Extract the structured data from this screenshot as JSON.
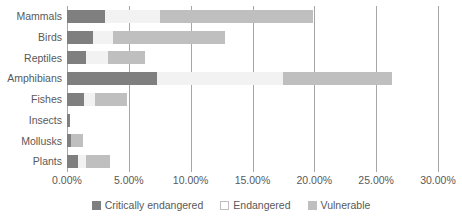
{
  "chart_data": {
    "type": "bar",
    "orientation": "horizontal",
    "stacked": true,
    "title": "",
    "xlabel": "",
    "ylabel": "",
    "xlim": [
      0,
      30
    ],
    "xticks": [
      0,
      5,
      10,
      15,
      20,
      25,
      30
    ],
    "xtick_labels": [
      "0.00%",
      "5.00%",
      "10.00%",
      "15.00%",
      "20.00%",
      "25.00%",
      "30.00%"
    ],
    "grid": true,
    "legend_position": "bottom",
    "categories": [
      "Mammals",
      "Birds",
      "Reptiles",
      "Amphibians",
      "Fishes",
      "Insects",
      "Mollusks",
      "Plants"
    ],
    "series": [
      {
        "name": "Critically endangered",
        "color": "#7f7f7f",
        "values": [
          3.1,
          2.1,
          1.5,
          7.3,
          1.4,
          0.25,
          0.35,
          0.9
        ]
      },
      {
        "name": "Endangered",
        "color": "#f2f2f2",
        "values": [
          4.4,
          1.6,
          1.8,
          10.2,
          0.9,
          0.0,
          0.0,
          0.65
        ]
      },
      {
        "name": "Vulnerable",
        "color": "#bfbfbf",
        "values": [
          12.4,
          9.1,
          3.0,
          8.8,
          2.55,
          0.0,
          0.95,
          1.95
        ]
      }
    ],
    "totals": [
      19.9,
      12.8,
      6.3,
      26.3,
      4.85,
      0.25,
      1.3,
      3.5
    ]
  },
  "legend": {
    "items": [
      {
        "label": "Critically endangered",
        "swatch": "critically-endangered-swatch"
      },
      {
        "label": "Endangered",
        "swatch": "endangered-swatch"
      },
      {
        "label": "Vulnerable",
        "swatch": "vulnerable-swatch"
      }
    ]
  }
}
